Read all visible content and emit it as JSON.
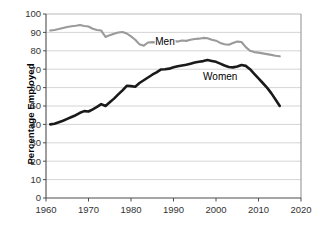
{
  "chart_data": {
    "type": "line",
    "title": "",
    "xlabel": "",
    "ylabel": "Percentage Employed",
    "xlim": [
      1960,
      2020
    ],
    "ylim": [
      0,
      100
    ],
    "xticks": [
      1960,
      1970,
      1980,
      1990,
      2000,
      2010,
      2020
    ],
    "yticks": [
      0,
      10,
      20,
      30,
      40,
      50,
      60,
      70,
      80,
      90,
      100
    ],
    "grid": "horizontal",
    "legend_position": "inline-labels",
    "series": [
      {
        "name": "Men",
        "color": "#9a9a9a",
        "label_x": 1988,
        "label_y": 83,
        "x": [
          1961,
          1962,
          1963,
          1964,
          1965,
          1966,
          1967,
          1968,
          1969,
          1970,
          1971,
          1972,
          1973,
          1974,
          1975,
          1976,
          1977,
          1978,
          1979,
          1980,
          1981,
          1982,
          1983,
          1984,
          1985,
          1986,
          1987,
          1988,
          1989,
          1990,
          1991,
          1992,
          1993,
          1994,
          1995,
          1996,
          1997,
          1998,
          1999,
          2000,
          2001,
          2002,
          2003,
          2004,
          2005,
          2006,
          2007,
          2008,
          2009,
          2010,
          2011,
          2012,
          2013,
          2014,
          2015
        ],
        "values": [
          91.0,
          91.3,
          91.8,
          92.4,
          92.9,
          93.3,
          93.6,
          94.0,
          93.5,
          93.2,
          92.0,
          91.3,
          91.0,
          87.5,
          88.5,
          89.3,
          89.9,
          90.2,
          89.4,
          87.8,
          86.0,
          83.5,
          82.8,
          84.5,
          84.7,
          84.6,
          85.0,
          84.5,
          86.0,
          85.5,
          85.0,
          85.6,
          85.4,
          86.0,
          86.4,
          86.6,
          87.0,
          86.8,
          86.0,
          85.5,
          84.3,
          83.6,
          83.3,
          84.2,
          85.0,
          84.8,
          82.0,
          80.0,
          79.3,
          79.0,
          78.6,
          78.2,
          77.8,
          77.3,
          77.0
        ]
      },
      {
        "name": "Women",
        "color": "#1a1a1a",
        "label_x": 2001,
        "label_y": 64,
        "x": [
          1961,
          1962,
          1963,
          1964,
          1965,
          1966,
          1967,
          1968,
          1969,
          1970,
          1971,
          1972,
          1973,
          1974,
          1975,
          1976,
          1977,
          1978,
          1979,
          1980,
          1981,
          1982,
          1983,
          1984,
          1985,
          1986,
          1987,
          1988,
          1989,
          1990,
          1991,
          1992,
          1993,
          1994,
          1995,
          1996,
          1997,
          1998,
          1999,
          2000,
          2001,
          2002,
          2003,
          2004,
          2005,
          2006,
          2007,
          2008,
          2009,
          2010,
          2011,
          2012,
          2013,
          2014,
          2015
        ],
        "values": [
          40.0,
          40.4,
          41.2,
          42.0,
          43.0,
          44.0,
          45.0,
          46.3,
          47.2,
          47.0,
          48.2,
          49.5,
          51.0,
          50.0,
          52.0,
          54.0,
          56.3,
          58.5,
          61.0,
          60.8,
          60.5,
          62.5,
          64.0,
          65.5,
          67.0,
          68.3,
          69.8,
          70.0,
          70.3,
          71.0,
          71.6,
          72.0,
          72.4,
          73.0,
          73.6,
          74.0,
          74.4,
          75.0,
          74.5,
          74.0,
          73.0,
          72.0,
          71.2,
          71.0,
          71.5,
          72.3,
          71.8,
          70.0,
          67.5,
          65.0,
          62.5,
          60.0,
          57.0,
          53.5,
          50.0
        ]
      }
    ]
  }
}
